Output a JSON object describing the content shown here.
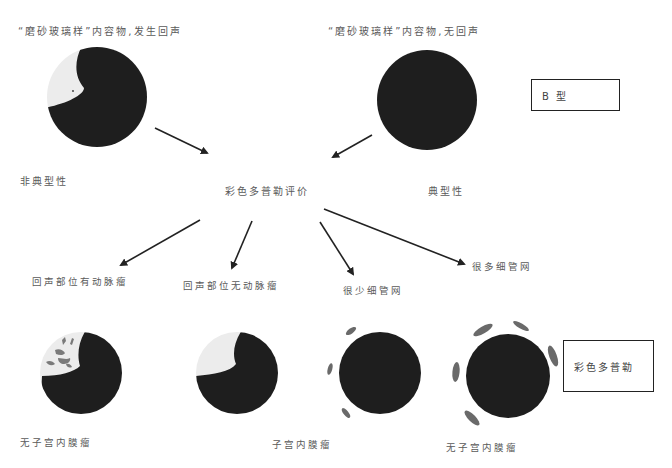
{
  "title_labels": {
    "top_left": "“磨砂玻璃样”内容物,发生回声",
    "top_right": "“磨砂玻璃样”内容物,无回声"
  },
  "type_boxes": {
    "b_type": "B 型",
    "color_doppler": "彩色多普勒"
  },
  "nodes": {
    "atypical": "非典型性",
    "typical": "典型性",
    "doppler_eval": "彩色多普勒评价",
    "echo_with_artery": "回声部位有动脉瘤",
    "echo_without_artery": "回声部位无动脉瘤",
    "few_capillaries": "很少细管网",
    "many_capillaries": "很多细管网"
  },
  "outcomes": {
    "o1": "无子宫内膜瘤",
    "o2": "子宫内膜瘤",
    "o3": "无子宫内膜瘤"
  },
  "colors": {
    "lesion_dark": "#1e1e1e",
    "echo_light": "#ececec",
    "vessel_gray": "#6a6a6a",
    "arrow": "#222222"
  }
}
